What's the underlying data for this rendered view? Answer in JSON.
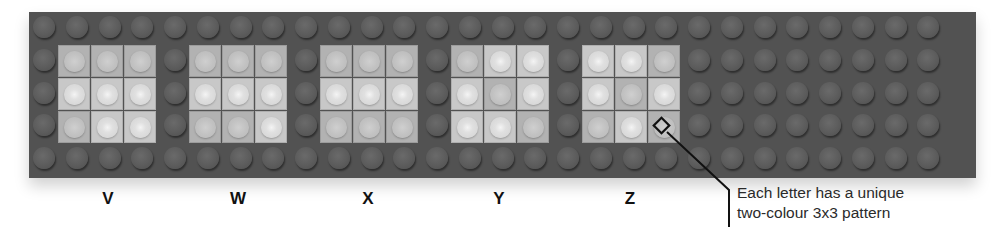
{
  "diagram": {
    "board": {
      "rows": 5,
      "columns": 28,
      "color": "#525252"
    },
    "plate_colors": {
      "light": "#c8c8c8",
      "dark": "#b2b2b2"
    },
    "letters": [
      {
        "label": "V",
        "pattern": [
          [
            "D",
            "D",
            "D"
          ],
          [
            "L",
            "L",
            "L"
          ],
          [
            "D",
            "L",
            "L"
          ]
        ]
      },
      {
        "label": "W",
        "pattern": [
          [
            "D",
            "D",
            "D"
          ],
          [
            "L",
            "L",
            "L"
          ],
          [
            "D",
            "D",
            "L"
          ]
        ]
      },
      {
        "label": "X",
        "pattern": [
          [
            "D",
            "D",
            "D"
          ],
          [
            "L",
            "L",
            "L"
          ],
          [
            "D",
            "D",
            "D"
          ]
        ]
      },
      {
        "label": "Y",
        "pattern": [
          [
            "D",
            "L",
            "L"
          ],
          [
            "L",
            "D",
            "L"
          ],
          [
            "L",
            "L",
            "D"
          ]
        ]
      },
      {
        "label": "Z",
        "pattern": [
          [
            "L",
            "L",
            "D"
          ],
          [
            "L",
            "D",
            "L"
          ],
          [
            "D",
            "L",
            "D"
          ]
        ]
      }
    ],
    "callout": {
      "line1": "Each letter has a unique",
      "line2": "two-colour 3x3 pattern",
      "marker": "diamond-marker"
    }
  }
}
